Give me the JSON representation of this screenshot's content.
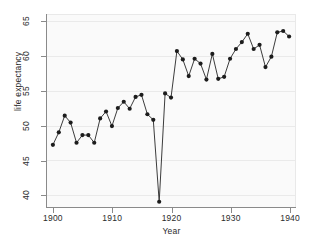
{
  "chart_data": {
    "type": "line",
    "title": "",
    "subtitle": "",
    "xlabel": "Year",
    "ylabel": "life expectancy",
    "xlim": [
      1899,
      1941
    ],
    "ylim": [
      38.2,
      66.0
    ],
    "xticks": [
      1900,
      1910,
      1920,
      1930,
      1940
    ],
    "xticklabels": [
      "1900",
      "1910",
      "1920",
      "1930",
      "1940"
    ],
    "yticks": [
      40,
      45,
      50,
      55,
      60,
      65
    ],
    "yticklabels": [
      "40",
      "45",
      "50",
      "55",
      "60",
      "65"
    ],
    "grid": "horizontal",
    "legend": "none",
    "marker": "filled-circle",
    "line_color": "#3a3a3a",
    "marker_color": "#1c1c1c",
    "plot_background": "#fafafa",
    "x": [
      1900,
      1901,
      1902,
      1903,
      1904,
      1905,
      1906,
      1907,
      1908,
      1909,
      1910,
      1911,
      1912,
      1913,
      1914,
      1915,
      1916,
      1917,
      1918,
      1919,
      1920,
      1921,
      1922,
      1923,
      1924,
      1925,
      1926,
      1927,
      1928,
      1929,
      1930,
      1931,
      1932,
      1933,
      1934,
      1935,
      1936,
      1937,
      1938,
      1939,
      1940
    ],
    "values": [
      47.3,
      49.1,
      51.5,
      50.5,
      47.6,
      48.7,
      48.7,
      47.6,
      51.1,
      52.1,
      50.0,
      52.6,
      53.5,
      52.5,
      54.2,
      54.5,
      51.7,
      50.9,
      39.1,
      54.7,
      54.1,
      60.8,
      59.6,
      57.2,
      59.7,
      59.0,
      56.7,
      60.4,
      56.8,
      57.1,
      59.7,
      61.1,
      62.1,
      63.3,
      61.1,
      61.7,
      58.5,
      60.0,
      63.5,
      63.7,
      62.9
    ],
    "annotations": []
  },
  "figure": {
    "background": "#ffffff",
    "axis_color": "#8a8a8a",
    "text_color": "#2b2b2b",
    "gridline_color": "#eaeaea"
  }
}
